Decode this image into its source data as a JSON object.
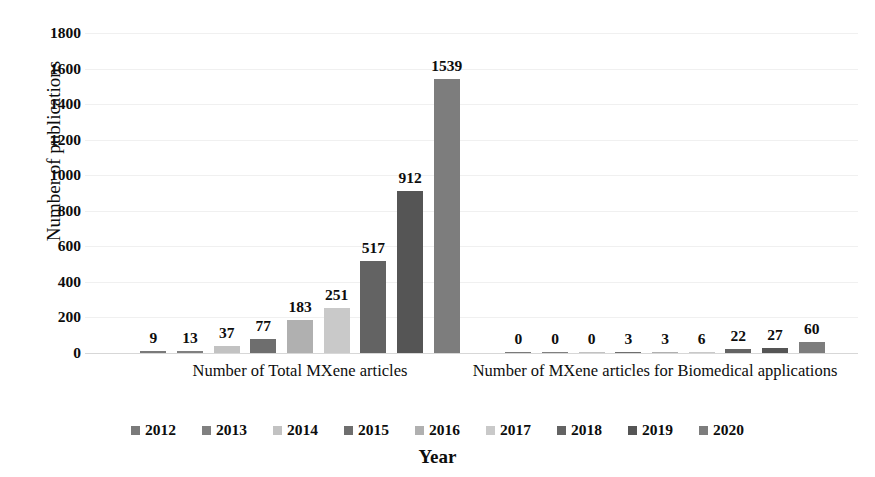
{
  "chart_data": {
    "type": "bar",
    "title": "",
    "xlabel": "Year",
    "ylabel": "Number of publications",
    "ylim": [
      0,
      1800
    ],
    "ytick_step": 200,
    "yticks": [
      1800,
      1600,
      1400,
      1200,
      1000,
      800,
      600,
      400,
      200,
      0
    ],
    "grid": true,
    "legend_position": "bottom",
    "categories": [
      "Number of Total MXene articles",
      "Number of MXene articles for Biomedical applications"
    ],
    "series": [
      {
        "name": "2012",
        "color": "#7a7a7a",
        "values": [
          9,
          0
        ]
      },
      {
        "name": "2013",
        "color": "#808080",
        "values": [
          13,
          0
        ]
      },
      {
        "name": "2014",
        "color": "#c2c2c2",
        "values": [
          37,
          0
        ]
      },
      {
        "name": "2015",
        "color": "#6e6e6e",
        "values": [
          77,
          3
        ]
      },
      {
        "name": "2016",
        "color": "#b0b0b0",
        "values": [
          183,
          3
        ]
      },
      {
        "name": "2017",
        "color": "#c9c9c9",
        "values": [
          251,
          6
        ]
      },
      {
        "name": "2018",
        "color": "#636363",
        "values": [
          517,
          22
        ]
      },
      {
        "name": "2019",
        "color": "#555555",
        "values": [
          912,
          27
        ]
      },
      {
        "name": "2020",
        "color": "#7d7d7d",
        "values": [
          1539,
          60
        ]
      }
    ],
    "data_labels": {
      "group1": [
        "9",
        "13",
        "37",
        "77",
        "183",
        "251",
        "517",
        "912",
        "1539"
      ],
      "group2": [
        "0",
        "0",
        "0",
        "3",
        "3",
        "6",
        "22",
        "27",
        "60"
      ]
    },
    "legend_entries": [
      "2012",
      "2013",
      "2014",
      "2015",
      "2016",
      "2017",
      "2018",
      "2019",
      "2020"
    ]
  }
}
